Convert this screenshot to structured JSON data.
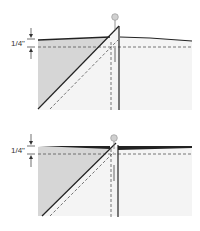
{
  "diagrams": [
    {
      "id": "step-1",
      "measurement_label": "1/4\"",
      "description": "Fabric corner folded diagonally with pin at top, seam allowance 1/4 inch marked"
    },
    {
      "id": "step-2",
      "measurement_label": "1/4\"",
      "description": "Fabric pressed flat with diagonal fold and pin at top, seam allowance 1/4 inch marked"
    }
  ],
  "colors": {
    "fabric_light": "#f4f4f4",
    "fabric_shaded": "#d9d9d9",
    "line": "#222222",
    "dashed": "#555555",
    "pin_head": "#cccccc"
  }
}
